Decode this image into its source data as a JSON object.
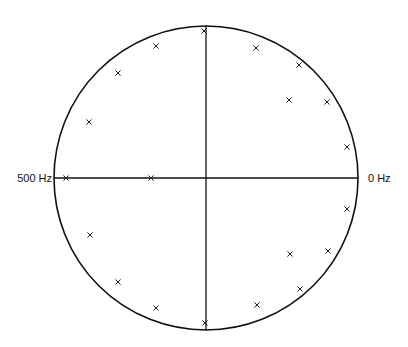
{
  "chart_data": {
    "type": "scatter",
    "title": "",
    "subtitle": "",
    "labels": {
      "right": "0 Hz",
      "left": "500 Hz"
    },
    "grid": false,
    "legend": null,
    "geometry": {
      "cx": 206,
      "cy": 178,
      "r": 152
    },
    "points_px": [
      {
        "x": 204,
        "y": 31
      },
      {
        "x": 156,
        "y": 46
      },
      {
        "x": 118,
        "y": 73
      },
      {
        "x": 89,
        "y": 122
      },
      {
        "x": 66,
        "y": 178
      },
      {
        "x": 151,
        "y": 178
      },
      {
        "x": 90,
        "y": 235
      },
      {
        "x": 118,
        "y": 282
      },
      {
        "x": 156,
        "y": 308
      },
      {
        "x": 205,
        "y": 323
      },
      {
        "x": 256,
        "y": 48
      },
      {
        "x": 299,
        "y": 65
      },
      {
        "x": 289,
        "y": 100
      },
      {
        "x": 327,
        "y": 102
      },
      {
        "x": 347,
        "y": 147
      },
      {
        "x": 347,
        "y": 209
      },
      {
        "x": 290,
        "y": 254
      },
      {
        "x": 328,
        "y": 251
      },
      {
        "x": 300,
        "y": 289
      },
      {
        "x": 257,
        "y": 305
      }
    ]
  }
}
